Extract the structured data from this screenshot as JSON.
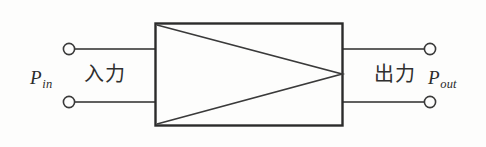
{
  "figure": {
    "kind": "amplifier-block-diagram",
    "background_color": "#fdfdfc",
    "line_color": "#2b2b2b",
    "labels": {
      "input_symbol_base": "P",
      "input_symbol_subscript": "in",
      "input_text_jp": "入力",
      "output_text_jp": "出力",
      "output_symbol_base": "P",
      "output_symbol_subscript": "out"
    },
    "geometry": {
      "box": {
        "x": 155,
        "y": 23,
        "width": 188,
        "height": 103
      },
      "triangle_apex": {
        "x": 343,
        "y": 74
      },
      "terminals": [
        {
          "name": "input-top",
          "cx": 69,
          "cy": 49,
          "r": 5
        },
        {
          "name": "input-bottom",
          "cx": 69,
          "cy": 102,
          "r": 5
        },
        {
          "name": "output-top",
          "cx": 430,
          "cy": 49,
          "r": 5
        },
        {
          "name": "output-bottom",
          "cx": 430,
          "cy": 102,
          "r": 5
        }
      ],
      "wires": [
        {
          "name": "input-top-wire",
          "x1": 75,
          "y1": 49,
          "x2": 155,
          "y2": 49
        },
        {
          "name": "input-bottom-wire",
          "x1": 75,
          "y1": 102,
          "x2": 155,
          "y2": 102
        },
        {
          "name": "output-top-wire",
          "x1": 343,
          "y1": 49,
          "x2": 425,
          "y2": 49
        },
        {
          "name": "output-bottom-wire",
          "x1": 343,
          "y1": 102,
          "x2": 425,
          "y2": 102
        }
      ]
    }
  }
}
